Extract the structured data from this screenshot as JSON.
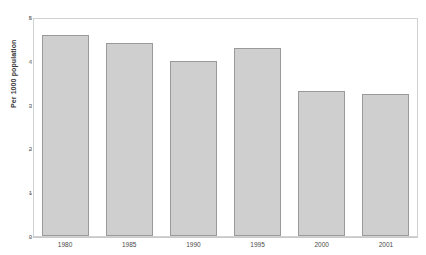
{
  "chart_data": {
    "type": "bar",
    "title": "",
    "xlabel": "",
    "ylabel": "Per 1000 population",
    "categories": [
      "1980",
      "1985",
      "1990",
      "1995",
      "2000",
      "2001"
    ],
    "values": [
      4.6,
      4.4,
      4.0,
      4.3,
      3.3,
      3.25
    ],
    "ylim": [
      0,
      5
    ],
    "yticks": [
      0,
      1,
      2,
      3,
      4,
      5
    ],
    "ytick_labels": [
      "0",
      "1",
      "2",
      "3",
      "4",
      "5"
    ],
    "grid": false,
    "legend": null,
    "series": [
      {
        "name": "Per 1000 population",
        "values": [
          4.6,
          4.4,
          4.0,
          4.3,
          3.3,
          3.25
        ]
      }
    ],
    "colors": {
      "bar_fill": "#cfcfcf",
      "bar_border": "#9a9a9a",
      "frame": "#d2d2d2",
      "text": "#4a4a4a",
      "background": "#ffffff"
    }
  }
}
